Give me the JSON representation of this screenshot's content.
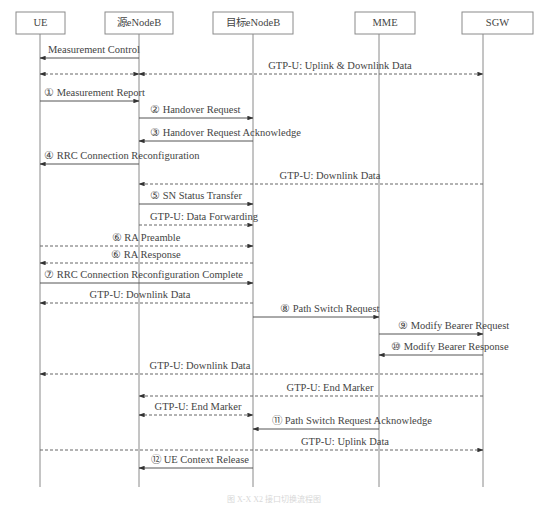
{
  "diagram": {
    "type": "sequence",
    "actors": [
      {
        "id": "ue",
        "label": "UE",
        "x": 40,
        "box": [
          16,
          12,
          49,
          22
        ]
      },
      {
        "id": "senb",
        "label": "源eNodeB",
        "x": 139,
        "box": [
          105,
          12,
          68,
          22
        ]
      },
      {
        "id": "tenb",
        "label": "目标eNodeB",
        "x": 253,
        "box": [
          213,
          12,
          80,
          22
        ]
      },
      {
        "id": "mme",
        "label": "MME",
        "x": 379,
        "box": [
          355,
          12,
          60,
          22
        ]
      },
      {
        "id": "sgw",
        "label": "SGW",
        "x": 483,
        "box": [
          462,
          12,
          71,
          22
        ]
      }
    ],
    "lifeline_end_y": 487,
    "messages": [
      {
        "step": "",
        "label": "Measurement Control",
        "from": "senb",
        "to": "ue",
        "y": 58,
        "style": "solid",
        "bidirectional": false,
        "label_x": 48,
        "align": "start"
      },
      {
        "step": "",
        "label": "GTP-U: Uplink & Downlink Data",
        "from": "senb",
        "to": "sgw",
        "y": 74,
        "style": "dashed",
        "bidirectional": true,
        "label_x": 340,
        "align": "middle"
      },
      {
        "step": "",
        "label": "",
        "from": "ue",
        "to": "senb",
        "y": 74,
        "style": "dashed",
        "bidirectional": true,
        "label_x": 0,
        "align": "start"
      },
      {
        "step": "①",
        "label": "① Measurement Report",
        "from": "ue",
        "to": "senb",
        "y": 101,
        "style": "solid",
        "bidirectional": false,
        "label_x": 44,
        "align": "start"
      },
      {
        "step": "②",
        "label": "② Handover Request",
        "from": "senb",
        "to": "tenb",
        "y": 118,
        "style": "solid",
        "bidirectional": false,
        "label_x": 150,
        "align": "start"
      },
      {
        "step": "③",
        "label": "③ Handover Request Acknowledge",
        "from": "tenb",
        "to": "senb",
        "y": 141,
        "style": "solid",
        "bidirectional": false,
        "label_x": 150,
        "align": "start"
      },
      {
        "step": "④",
        "label": "④ RRC Connection Reconfiguration",
        "from": "senb",
        "to": "ue",
        "y": 164,
        "style": "solid",
        "bidirectional": false,
        "label_x": 44,
        "align": "start"
      },
      {
        "step": "",
        "label": "GTP-U: Downlink Data",
        "from": "sgw",
        "to": "senb",
        "y": 184,
        "style": "dashed",
        "bidirectional": false,
        "label_x": 330,
        "align": "middle"
      },
      {
        "step": "⑤",
        "label": "⑤ SN Status Transfer",
        "from": "senb",
        "to": "tenb",
        "y": 204,
        "style": "solid",
        "bidirectional": false,
        "label_x": 150,
        "align": "start"
      },
      {
        "step": "",
        "label": "GTP-U: Data Forwarding",
        "from": "senb",
        "to": "tenb",
        "y": 225,
        "style": "dashed",
        "bidirectional": false,
        "label_x": 150,
        "align": "start"
      },
      {
        "step": "⑥",
        "label": "⑥ RA Preamble",
        "from": "ue",
        "to": "tenb",
        "y": 246,
        "style": "dashed",
        "bidirectional": false,
        "label_x": 146,
        "align": "middle"
      },
      {
        "step": "⑥",
        "label": "⑥ RA Response",
        "from": "tenb",
        "to": "ue",
        "y": 263,
        "style": "dashed",
        "bidirectional": false,
        "label_x": 146,
        "align": "middle"
      },
      {
        "step": "⑦",
        "label": "⑦ RRC Connection Reconfiguration Complete",
        "from": "ue",
        "to": "tenb",
        "y": 283,
        "style": "solid",
        "bidirectional": false,
        "label_x": 44,
        "align": "start"
      },
      {
        "step": "",
        "label": "GTP-U: Downlink Data",
        "from": "tenb",
        "to": "ue",
        "y": 303,
        "style": "dashed",
        "bidirectional": false,
        "label_x": 140,
        "align": "middle"
      },
      {
        "step": "⑧",
        "label": "⑧ Path Switch Request",
        "from": "tenb",
        "to": "mme",
        "y": 317,
        "style": "solid",
        "bidirectional": false,
        "label_x": 280,
        "align": "start"
      },
      {
        "step": "⑨",
        "label": "⑨ Modify Bearer Request",
        "from": "mme",
        "to": "sgw",
        "y": 334,
        "style": "solid",
        "bidirectional": false,
        "label_x": 398,
        "align": "start"
      },
      {
        "step": "⑩",
        "label": "⑩ Modify Bearer Response",
        "from": "sgw",
        "to": "mme",
        "y": 355,
        "style": "solid",
        "bidirectional": false,
        "label_x": 391,
        "align": "start"
      },
      {
        "step": "",
        "label": "GTP-U: Downlink Data",
        "from": "sgw",
        "to": "ue",
        "y": 374,
        "style": "dashed",
        "bidirectional": false,
        "label_x": 200,
        "align": "middle"
      },
      {
        "step": "",
        "label": "GTP-U: End Marker",
        "from": "sgw",
        "to": "senb",
        "y": 396,
        "style": "dashed",
        "bidirectional": false,
        "label_x": 330,
        "align": "middle"
      },
      {
        "step": "",
        "label": "GTP-U: End Marker",
        "from": "senb",
        "to": "tenb",
        "y": 415,
        "style": "dashed",
        "bidirectional": true,
        "label_x": 198,
        "align": "middle"
      },
      {
        "step": "⑪",
        "label": "⑪ Path Switch Request Acknowledge",
        "from": "mme",
        "to": "tenb",
        "y": 429,
        "style": "solid",
        "bidirectional": false,
        "label_x": 272,
        "align": "start"
      },
      {
        "step": "",
        "label": "GTP-U: Uplink Data",
        "from": "ue",
        "to": "sgw",
        "y": 450,
        "style": "dashed",
        "bidirectional": false,
        "label_x": 345,
        "align": "middle"
      },
      {
        "step": "⑫",
        "label": "⑫ UE Context Release",
        "from": "tenb",
        "to": "senb",
        "y": 468,
        "style": "solid",
        "bidirectional": false,
        "label_x": 200,
        "align": "middle"
      }
    ],
    "caption": "图 X-X  X2 接口切换流程图"
  }
}
